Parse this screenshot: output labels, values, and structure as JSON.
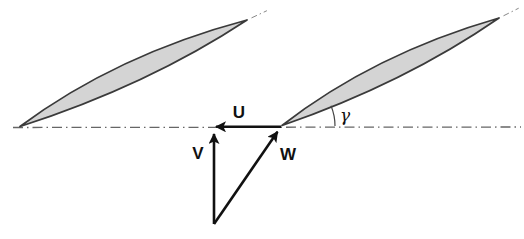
{
  "labels": {
    "u": "U",
    "v": "V",
    "w": "W",
    "gamma": "γ"
  },
  "colors": {
    "background": "#ffffff",
    "blade_fill": "#d4d4d4",
    "blade_outline": "#3a3a3a",
    "centerline": "#666666",
    "chord_ext": "#888888",
    "vector": "#111111",
    "arc": "#444444",
    "text": "#111111"
  },
  "geometry": {
    "centerline": [
      13,
      127.5,
      521,
      127
    ],
    "blades": [
      {
        "le": [
          20,
          126.5
        ],
        "te": [
          247,
          20
        ]
      },
      {
        "le": [
          282,
          125.5
        ],
        "te": [
          499,
          18
        ]
      }
    ],
    "upper_camber": 0.048,
    "lower_camber": 0.034,
    "camber_pos_upper": 0.47,
    "camber_pos_lower": 0.53,
    "chord_ext": 22,
    "vectors": {
      "u": [
        281,
        126.8,
        216,
        126.8
      ],
      "v": [
        214,
        224,
        214,
        134
      ],
      "w": [
        214,
        224,
        277.5,
        131.8
      ]
    },
    "angle_arc": {
      "cx": 282,
      "cy": 126,
      "r": 53,
      "deg": 22.5
    },
    "label_pos": {
      "u": [
        239,
        112
      ],
      "v": [
        198,
        153
      ],
      "w": [
        288,
        154
      ],
      "gamma": [
        345,
        115
      ]
    }
  }
}
